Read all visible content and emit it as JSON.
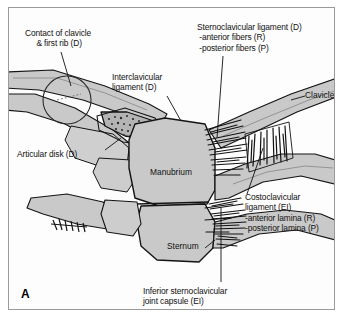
{
  "figure": {
    "panel_letter": "A",
    "caption_labels": {
      "contact_clavicle_first_rib": "Contact of clavicle\n & first rib (D)",
      "interclavicular_ligament": "Interclavicular\nligament (D)",
      "sternoclavicular_ligament": "Sternoclavicular ligament (D)\n -anterior fibers (R)\n -posterior fibers (P)",
      "clavicle": "Clavicle",
      "articular_disk": "Articular disk (D)",
      "manubrium": "Manubrium",
      "costoclavicular_ligament": "Costoclavicular\nligament (EI)\n-anterior lamina (R)\n-posterior lamina (P)",
      "sternum": "Sternum",
      "inferior_joint_capsule": "Inferior sternoclavicular\njoint capsule (EI)"
    }
  },
  "colors": {
    "bone_fill": "#c9c9c9",
    "bone_fill_light": "#d6d6d6",
    "bone_fill_dark": "#bdbdbd",
    "outline": "#141414",
    "frame_border": "#9a9a9a",
    "page_background": "#ffffff",
    "text": "#111111",
    "disk_fill": "#b4b4b4"
  }
}
